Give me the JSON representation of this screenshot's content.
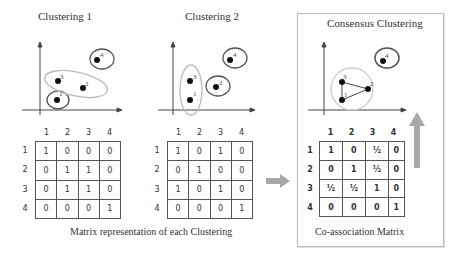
{
  "panels": [
    {
      "title": "Clustering 1",
      "points": [
        {
          "id": "1",
          "x": 57,
          "y": 100
        },
        {
          "id": "2",
          "x": 83,
          "y": 88
        },
        {
          "id": "3",
          "x": 58,
          "y": 81
        },
        {
          "id": "4",
          "x": 97,
          "y": 60
        }
      ],
      "clusters": [
        {
          "members": [
            "1"
          ],
          "shape": "circle"
        },
        {
          "members": [
            "2",
            "3"
          ],
          "shape": "ellipse"
        },
        {
          "members": [
            "4"
          ],
          "shape": "circle"
        }
      ],
      "matrix": {
        "col_headers": [
          "1",
          "2",
          "3",
          "4"
        ],
        "row_headers": [
          "1",
          "2",
          "3",
          "4"
        ],
        "rows": [
          [
            "1",
            "0",
            "0",
            "0"
          ],
          [
            "0",
            "1",
            "1",
            "0"
          ],
          [
            "0",
            "1",
            "1",
            "0"
          ],
          [
            "0",
            "0",
            "0",
            "1"
          ]
        ]
      }
    },
    {
      "title": "Clustering 2",
      "points": [
        {
          "id": "1",
          "x": 190,
          "y": 100
        },
        {
          "id": "2",
          "x": 216,
          "y": 87
        },
        {
          "id": "3",
          "x": 190,
          "y": 81
        },
        {
          "id": "4",
          "x": 230,
          "y": 60
        }
      ],
      "clusters": [
        {
          "members": [
            "1",
            "3"
          ],
          "shape": "ellipse"
        },
        {
          "members": [
            "2"
          ],
          "shape": "circle"
        },
        {
          "members": [
            "4"
          ],
          "shape": "circle"
        }
      ],
      "matrix": {
        "col_headers": [
          "1",
          "2",
          "3",
          "4"
        ],
        "row_headers": [
          "1",
          "2",
          "3",
          "4"
        ],
        "rows": [
          [
            "1",
            "0",
            "1",
            "0"
          ],
          [
            "0",
            "1",
            "0",
            "0"
          ],
          [
            "1",
            "0",
            "1",
            "0"
          ],
          [
            "0",
            "0",
            "0",
            "1"
          ]
        ]
      }
    }
  ],
  "consensus": {
    "title": "Consensus Clustering",
    "points": [
      {
        "id": "1",
        "x": 342,
        "y": 100
      },
      {
        "id": "2",
        "x": 368,
        "y": 89
      },
      {
        "id": "3",
        "x": 342,
        "y": 82
      },
      {
        "id": "4",
        "x": 383,
        "y": 61
      }
    ],
    "edges": [
      [
        "1",
        "2"
      ],
      [
        "2",
        "3"
      ],
      [
        "1",
        "3"
      ]
    ],
    "matrix": {
      "col_headers": [
        "1",
        "2",
        "3",
        "4"
      ],
      "row_headers": [
        "1",
        "2",
        "3",
        "4"
      ],
      "rows": [
        [
          "1",
          "0",
          "½",
          "0"
        ],
        [
          "0",
          "1",
          "½",
          "0"
        ],
        [
          "½",
          "½",
          "1",
          "0"
        ],
        [
          "0",
          "0",
          "0",
          "1"
        ]
      ]
    },
    "caption": "Co-association Matrix"
  },
  "matrix_caption": "Matrix representation of each Clustering",
  "colors": {
    "arrow": "#a8a8a8",
    "line": "#444444",
    "cluster_dark": "#555555",
    "cluster_light": "#bbbbbb",
    "box_border": "#bbbbbb"
  }
}
